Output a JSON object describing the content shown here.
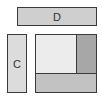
{
  "diagram": {
    "blocks": [
      {
        "id": "D",
        "label": "D",
        "color": "#cfcfcf"
      },
      {
        "id": "C",
        "label": "C",
        "color": "#dcdcdc"
      }
    ],
    "composite": {
      "parts": [
        {
          "id": "top-left",
          "label": "",
          "color": "#ececec"
        },
        {
          "id": "top-right",
          "label": "",
          "color": "#a7a7a7"
        },
        {
          "id": "bottom",
          "label": "",
          "color": "#c2c2c2"
        }
      ]
    },
    "border_color": "#3a3a3a"
  }
}
